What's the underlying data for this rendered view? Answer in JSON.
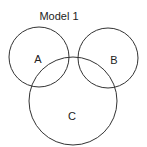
{
  "title": "Model 1",
  "circles": [
    {
      "label": "A",
      "cx": 39,
      "cy": 57,
      "r": 30
    },
    {
      "label": "B",
      "cx": 108,
      "cy": 58,
      "r": 30
    },
    {
      "label": "C",
      "cx": 73,
      "cy": 101,
      "r": 44
    }
  ],
  "colors": {
    "stroke": "#333333",
    "text": "#222222"
  }
}
